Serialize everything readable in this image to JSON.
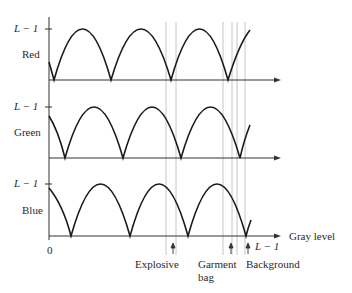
{
  "panels": [
    {
      "name": "Red",
      "lmax_label": "L − 1"
    },
    {
      "name": "Green",
      "lmax_label": "L − 1"
    },
    {
      "name": "Blue",
      "lmax_label": "L − 1"
    }
  ],
  "x_axis": {
    "origin_label": "0",
    "end_label": "L − 1",
    "title": "Gray level"
  },
  "annotations": {
    "explosive": "Explosive",
    "garment_line1": "Garment",
    "garment_line2": "bag",
    "background": "Background"
  },
  "colors": {
    "curve": "#1a1a1a",
    "axis": "#333333",
    "guide": "#b0b0b0"
  }
}
